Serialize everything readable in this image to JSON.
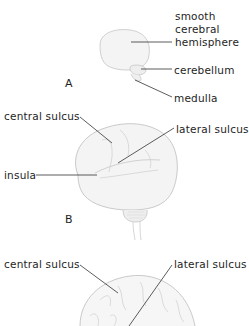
{
  "figure": {
    "panels": [
      {
        "id": "A",
        "label": "A",
        "labels": {
          "hemisphere_line1": "smooth",
          "hemisphere_line2": "cerebral",
          "hemisphere_line3": "hemisphere",
          "cerebellum": "cerebellum",
          "medulla": "medulla"
        }
      },
      {
        "id": "B",
        "label": "B",
        "labels": {
          "central_sulcus": "central sulcus",
          "lateral_sulcus": "lateral sulcus",
          "insula": "insula"
        }
      },
      {
        "id": "C",
        "labels": {
          "central_sulcus": "central sulcus",
          "lateral_sulcus": "lateral sulcus"
        }
      }
    ],
    "colors": {
      "background": "#ffffff",
      "text": "#1e1e1e",
      "outline": "#b8b8b8",
      "fill": "#f3f3f3",
      "leader": "#333333"
    }
  }
}
